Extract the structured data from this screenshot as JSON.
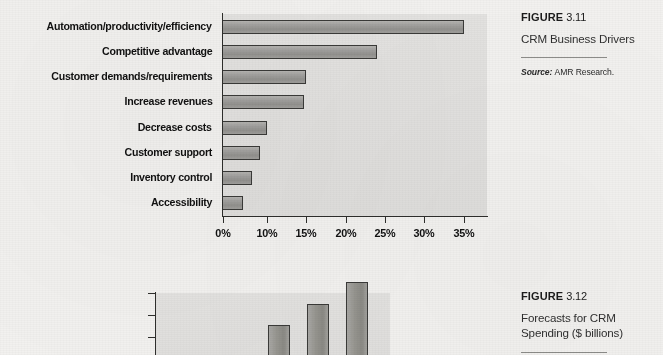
{
  "page": {
    "background": "#f3f2f0",
    "plot_area_color": "#e3e2e0",
    "bar_color": "#9a9995",
    "axis_color": "#2e2e2c"
  },
  "figure_311": {
    "caption_label": "FIGURE",
    "caption_number": "3.11",
    "caption_title": "CRM Business Drivers",
    "source_label": "Source:",
    "source_text": "AMR Research."
  },
  "figure_312": {
    "caption_label": "FIGURE",
    "caption_number": "3.12",
    "caption_title_line1": "Forecasts for CRM",
    "caption_title_line2": "Spending ($ billions)"
  },
  "chart_data": [
    {
      "id": "fig311",
      "type": "bar",
      "orientation": "horizontal",
      "title": "CRM Business Drivers",
      "xlabel": "",
      "ylabel": "",
      "grid": false,
      "legend": "none",
      "xlim": [
        0,
        37
      ],
      "categories": [
        "Automation/productivity/efficiency",
        "Competitive advantage",
        "Customer demands/requirements",
        "Increase revenues",
        "Decrease costs",
        "Customer support",
        "Inventory control",
        "Accessibility"
      ],
      "values": [
        35,
        24,
        15,
        14.7,
        10,
        8.4,
        6.5,
        4.5
      ],
      "tick_labels": [
        "0%",
        "10%",
        "15%",
        "20%",
        "25%",
        "30%",
        "35%"
      ],
      "tick_values": [
        0,
        10,
        15,
        20,
        25,
        30,
        35
      ],
      "tick_px": [
        223,
        267,
        306,
        346,
        385,
        424,
        464
      ]
    },
    {
      "id": "fig312",
      "type": "bar",
      "orientation": "vertical",
      "title": "Forecasts for CRM Spending ($ billions)",
      "note": "chart is cropped at the bottom edge of the screenshot",
      "xlabel": "",
      "ylabel": "$ billions",
      "grid": false,
      "legend": "none",
      "ylim": [
        null,
        20
      ],
      "tick_labels": [
        "$20",
        "18",
        "16"
      ],
      "tick_values": [
        20,
        18,
        16
      ],
      "values": [
        16.1,
        17.8,
        19.6
      ],
      "categories": [
        "",
        "",
        ""
      ]
    }
  ]
}
